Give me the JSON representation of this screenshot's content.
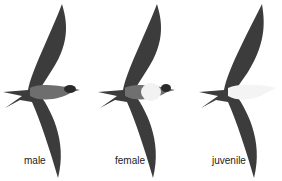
{
  "figure": {
    "birds": [
      {
        "label": "male",
        "belly": "#7a7a7a"
      },
      {
        "label": "female",
        "belly": "#f2f2f2"
      },
      {
        "label": "juvenile",
        "belly": "#f4f4f4"
      }
    ]
  }
}
